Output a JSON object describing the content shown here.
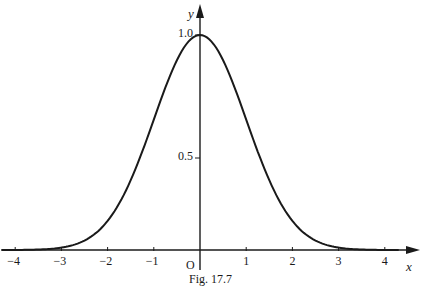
{
  "chart_data": {
    "type": "line",
    "title": "",
    "caption": "Fig. 17.7",
    "xlabel": "x",
    "ylabel": "y",
    "origin_label": "O",
    "function": "y = e^(-x^2/2)",
    "xlim": [
      -4.2,
      4.6
    ],
    "ylim": [
      0,
      1.2
    ],
    "grid": false,
    "legend": null,
    "x_ticks": [
      -4,
      -3,
      -2,
      -1,
      1,
      2,
      3,
      4
    ],
    "x_tick_labels": [
      "−4",
      "−3",
      "−2",
      "−1",
      "1",
      "2",
      "3",
      "4"
    ],
    "y_ticks": [
      0.5,
      1.0
    ],
    "y_tick_labels": [
      "0.5",
      "1.0"
    ],
    "series": [
      {
        "name": "curve",
        "x": [
          -4,
          -3.5,
          -3,
          -2.5,
          -2,
          -1.5,
          -1,
          -0.5,
          0,
          0.5,
          1,
          1.5,
          2,
          2.5,
          3,
          3.5,
          4
        ],
        "values": [
          0.0003,
          0.002,
          0.011,
          0.044,
          0.135,
          0.325,
          0.607,
          0.882,
          1.0,
          0.882,
          0.607,
          0.325,
          0.135,
          0.044,
          0.011,
          0.002,
          0.0003
        ]
      }
    ]
  }
}
